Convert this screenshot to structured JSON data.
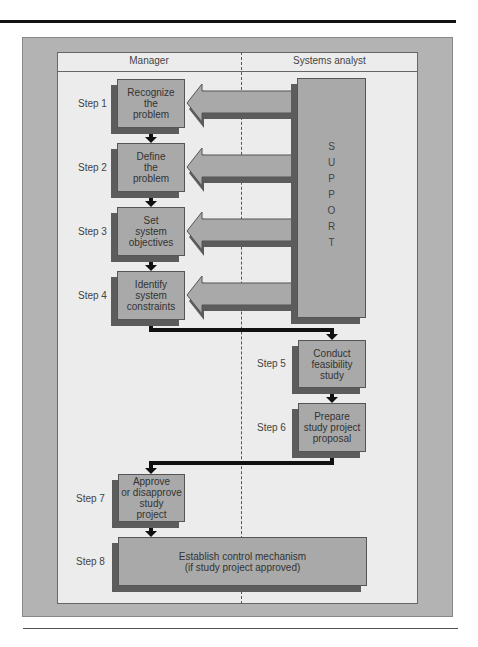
{
  "diagram": {
    "columns": {
      "left": "Manager",
      "right": "Systems analyst"
    },
    "support_label": [
      "S",
      "U",
      "P",
      "P",
      "O",
      "R",
      "T"
    ],
    "steps": [
      {
        "label": "Step 1",
        "text": "Recognize\nthe\nproblem",
        "owner": "Manager"
      },
      {
        "label": "Step 2",
        "text": "Define\nthe\nproblem",
        "owner": "Manager"
      },
      {
        "label": "Step 3",
        "text": "Set\nsystem\nobjectives",
        "owner": "Manager"
      },
      {
        "label": "Step 4",
        "text": "Identify\nsystem\nconstraints",
        "owner": "Manager"
      },
      {
        "label": "Step 5",
        "text": "Conduct\nfeasibility\nstudy",
        "owner": "Systems analyst"
      },
      {
        "label": "Step 6",
        "text": "Prepare\nstudy project\nproposal",
        "owner": "Systems analyst"
      },
      {
        "label": "Step 7",
        "text": "Approve\nor disapprove\nstudy\nproject",
        "owner": "Manager"
      },
      {
        "label": "Step 8",
        "text": "Establish control mechanism\n(if study project approved)",
        "owner": "Both"
      }
    ],
    "colors": {
      "box_fill": "#a9a9a9",
      "box_shadow": "#5c5c5c",
      "panel": "#ececec",
      "frame": "#b3b3b3",
      "connector": "#111111"
    }
  }
}
